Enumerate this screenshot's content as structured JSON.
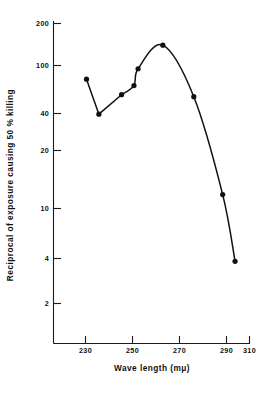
{
  "chart_data": {
    "type": "line",
    "title": "",
    "xlabel": "Wave length (mμ)",
    "ylabel": "Reciprocal of exposure causing 50 % killing",
    "xlim": [
      215,
      312
    ],
    "ylim": [
      1.55,
      230
    ],
    "yscale": "log",
    "xscale": "linear",
    "grid": false,
    "legend": null,
    "xticks": [
      230,
      250,
      270,
      290,
      310
    ],
    "xtick_labels": [
      "230",
      "250",
      "270",
      "290",
      "310"
    ],
    "yticks": [
      200,
      100,
      40,
      20,
      10,
      4,
      2
    ],
    "ytick_labels": [
      "200",
      "100",
      "40",
      "20",
      "10",
      "4",
      "2"
    ],
    "markers": "filled-circle",
    "series": [
      {
        "name": "Reciprocal of exposure causing 50 % killing",
        "x": [
          231,
          237,
          248,
          254,
          256,
          268,
          283,
          297,
          303
        ],
        "y": [
          80,
          45,
          62,
          72,
          95,
          140,
          60,
          12,
          4
        ]
      }
    ]
  },
  "axes": {
    "x_title": "Wave length (mμ)",
    "y_title": "Reciprocal of exposure causing 50 % killing"
  }
}
